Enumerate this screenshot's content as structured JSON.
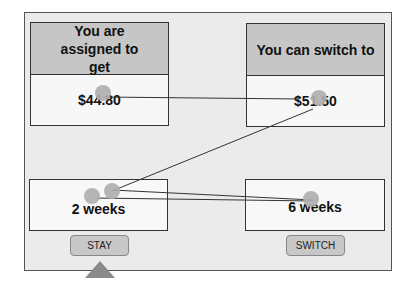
{
  "left_option": {
    "header": "You are assigned to get",
    "amount": "$44.80",
    "delay": "2 weeks",
    "button_label": "STAY"
  },
  "right_option": {
    "header": "You can switch to",
    "amount": "$51.50",
    "delay": "6 weeks",
    "button_label": "SWITCH"
  },
  "selection_marker": "triangle-up-icon",
  "gaze_overlay": {
    "fixation_color": "#b0b0b0",
    "line_color": "#333333",
    "fixations": [
      {
        "x": 103,
        "y": 93
      },
      {
        "x": 319,
        "y": 98
      },
      {
        "x": 92,
        "y": 196
      },
      {
        "x": 112,
        "y": 191
      },
      {
        "x": 311,
        "y": 199
      }
    ]
  }
}
